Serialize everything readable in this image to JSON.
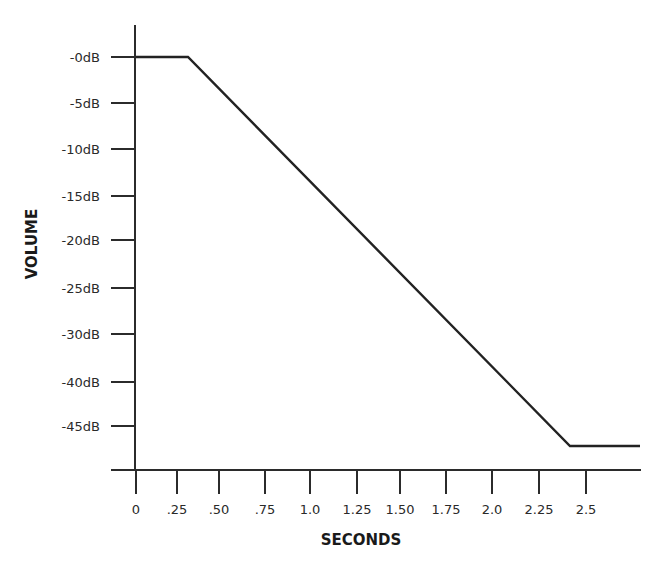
{
  "chart_data": {
    "type": "line",
    "title": "",
    "xlabel": "SECONDS",
    "ylabel": "VOLUME",
    "x_ticks": [
      "0",
      ".25",
      ".50",
      ".75",
      "1.0",
      "1.25",
      "1.50",
      "1.75",
      "2.0",
      "2.25",
      "2.5"
    ],
    "y_ticks": [
      "-0dB",
      "-5dB",
      "-10dB",
      "-15dB",
      "-20dB",
      "-25dB",
      "-30dB",
      "-40dB",
      "-45dB"
    ],
    "series": [
      {
        "name": "volume envelope",
        "points": [
          {
            "x": 0.0,
            "y": "-0dB"
          },
          {
            "x": 0.3,
            "y": "-0dB"
          },
          {
            "x": 2.4,
            "y": "below -45dB"
          },
          {
            "x": 2.7,
            "y": "below -45dB"
          }
        ]
      }
    ],
    "xlim": [
      0,
      2.7
    ],
    "grid": false,
    "legend": null,
    "color": "#222222"
  },
  "layout": {
    "x_tick_px": [
      136,
      177,
      219,
      265,
      310,
      357,
      400,
      446,
      492,
      539,
      586
    ],
    "y_tick_px": [
      57,
      103,
      149,
      196,
      240,
      288,
      334,
      382,
      426
    ],
    "line_px": [
      [
        136,
        57
      ],
      [
        188,
        57
      ],
      [
        570,
        446
      ],
      [
        640,
        446
      ]
    ]
  }
}
